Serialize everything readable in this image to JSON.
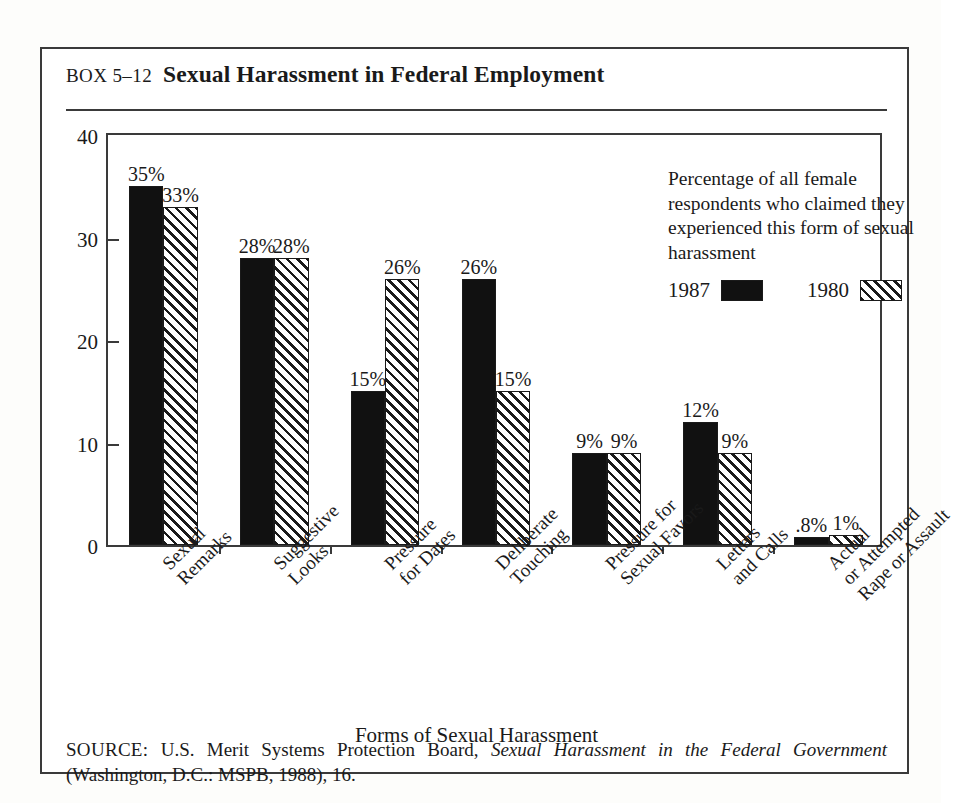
{
  "box": {
    "number": "BOX 5–12",
    "title": "Sexual Harassment in Federal Employment"
  },
  "legend": {
    "description": "Percentage of all female respondents who claimed they experienced this form of sexual harassment",
    "keys": [
      {
        "label": "1987",
        "swatch": "solid-black"
      },
      {
        "label": "1980",
        "swatch": "diagonal-hatch"
      }
    ]
  },
  "source": {
    "keyword": "SOURCE:",
    "text_before": " U.S. Merit Systems Protection Board, ",
    "italic_title": "Sexual Harassment in the Federal Government",
    "text_after": " (Washington, D.C.: MSPB, 1988), 16."
  },
  "colors": {
    "series_1987": "#111111",
    "series_1980_hatch": "#1a1a1a",
    "frame": "#3a3a3a",
    "page_background": "#ffffff"
  },
  "chart_data": {
    "type": "bar",
    "title": "Sexual Harassment in Federal Employment",
    "xlabel": "Forms of Sexual Harassment",
    "ylabel": "",
    "ylim": [
      0,
      40
    ],
    "yticks": [
      0,
      10,
      20,
      30,
      40
    ],
    "ytick_labels": [
      "0",
      "10",
      "20",
      "30",
      "40"
    ],
    "grid": false,
    "legend_position": "upper-right-inside",
    "categories": [
      "Sexual Remarks",
      "Suggestive Looks",
      "Pressure for Dates",
      "Deliberate Touching",
      "Pressure for Sexual Favors",
      "Letters and Calls",
      "Actual or Attempted Rape or Assault"
    ],
    "category_lines": [
      [
        "Sexual",
        "Remarks"
      ],
      [
        "Suggestive",
        "Looks"
      ],
      [
        "Pressure",
        "for Dates"
      ],
      [
        "Deliberate",
        "Touching"
      ],
      [
        "Pressure for",
        "Sexual Favors"
      ],
      [
        "Letters",
        "and Calls"
      ],
      [
        "Actual",
        "or Attempted",
        "Rape or Assault"
      ]
    ],
    "series": [
      {
        "name": "1987",
        "values": [
          35,
          28,
          15,
          26,
          9,
          12,
          0.8
        ],
        "labels": [
          "35%",
          "28%",
          "15%",
          "26%",
          "9%",
          "12%",
          ".8%"
        ]
      },
      {
        "name": "1980",
        "values": [
          33,
          28,
          26,
          15,
          9,
          9,
          1
        ],
        "labels": [
          "33%",
          "28%",
          "26%",
          "15%",
          "9%",
          "9%",
          "1%"
        ]
      }
    ]
  }
}
